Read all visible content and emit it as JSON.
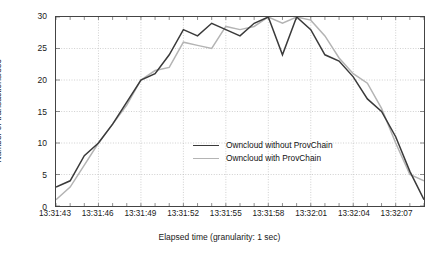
{
  "chart_data": {
    "type": "line",
    "title": "",
    "xlabel": "Elapsed time (granularity: 1 sec)",
    "ylabel": "Number of transactions/sec",
    "ylim": [
      0,
      30
    ],
    "yticks": [
      0,
      5,
      10,
      15,
      20,
      25,
      30
    ],
    "xticks": [
      "13:31:43",
      "13:31:46",
      "13:31:49",
      "13:31:52",
      "13:31:55",
      "13:31:58",
      "13:32:01",
      "13:32:04",
      "13:32:07"
    ],
    "xtick_seconds": [
      0,
      3,
      6,
      9,
      12,
      15,
      18,
      21,
      24
    ],
    "xlim_seconds": [
      0,
      26
    ],
    "grid": true,
    "legend_position": "center",
    "x": [
      "13:31:43",
      "13:31:44",
      "13:31:45",
      "13:31:46",
      "13:31:47",
      "13:31:48",
      "13:31:49",
      "13:31:50",
      "13:31:51",
      "13:31:52",
      "13:31:53",
      "13:31:54",
      "13:31:55",
      "13:31:56",
      "13:31:57",
      "13:31:58",
      "13:31:59",
      "13:32:00",
      "13:32:01",
      "13:32:02",
      "13:32:03",
      "13:32:04",
      "13:32:05",
      "13:32:06",
      "13:32:07",
      "13:32:08",
      "13:32:09"
    ],
    "series": [
      {
        "name": "Owncloud without ProvChain",
        "color": "#3a3a3a",
        "width": 1.5,
        "values": [
          3,
          4,
          8,
          10,
          13,
          16.5,
          20,
          21,
          24,
          28,
          27,
          29,
          28,
          27,
          29,
          30,
          24,
          30,
          28,
          24,
          23,
          20.5,
          17,
          15,
          11,
          5.5,
          1
        ]
      },
      {
        "name": "Owncloud with ProvChain",
        "color": "#b4b4b4",
        "width": 1.5,
        "values": [
          1,
          3,
          6.5,
          10,
          13,
          16,
          20,
          21.5,
          22,
          26,
          25.5,
          25,
          28.5,
          28,
          28.5,
          30,
          29,
          30,
          29.5,
          27,
          23.5,
          21,
          19.5,
          15.5,
          10,
          5,
          4
        ]
      }
    ]
  },
  "axes": {
    "y_label": "Number of transactions/sec",
    "x_label": "Elapsed time (granularity: 1 sec)"
  },
  "legend": {
    "items": [
      {
        "label": "Owncloud without ProvChain",
        "color": "#3a3a3a"
      },
      {
        "label": "Owncloud with ProvChain",
        "color": "#b4b4b4"
      }
    ]
  },
  "style": {
    "grid_color": "#b9b9b9",
    "frame_color": "#444444",
    "text_color": "#1a1a1a",
    "background": "#ffffff"
  }
}
